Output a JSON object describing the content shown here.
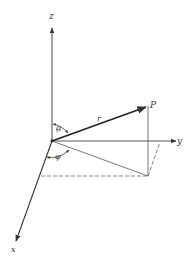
{
  "figure": {
    "type": "spherical-coordinates-diagram",
    "labels": {
      "z_axis": "z",
      "y_axis": "y",
      "x_axis": "x",
      "point": "P",
      "radius": "r",
      "polar_angle": "θ",
      "azimuth_angle": "φ"
    },
    "colors": {
      "line": "#333333",
      "background": "#ffffff"
    }
  }
}
